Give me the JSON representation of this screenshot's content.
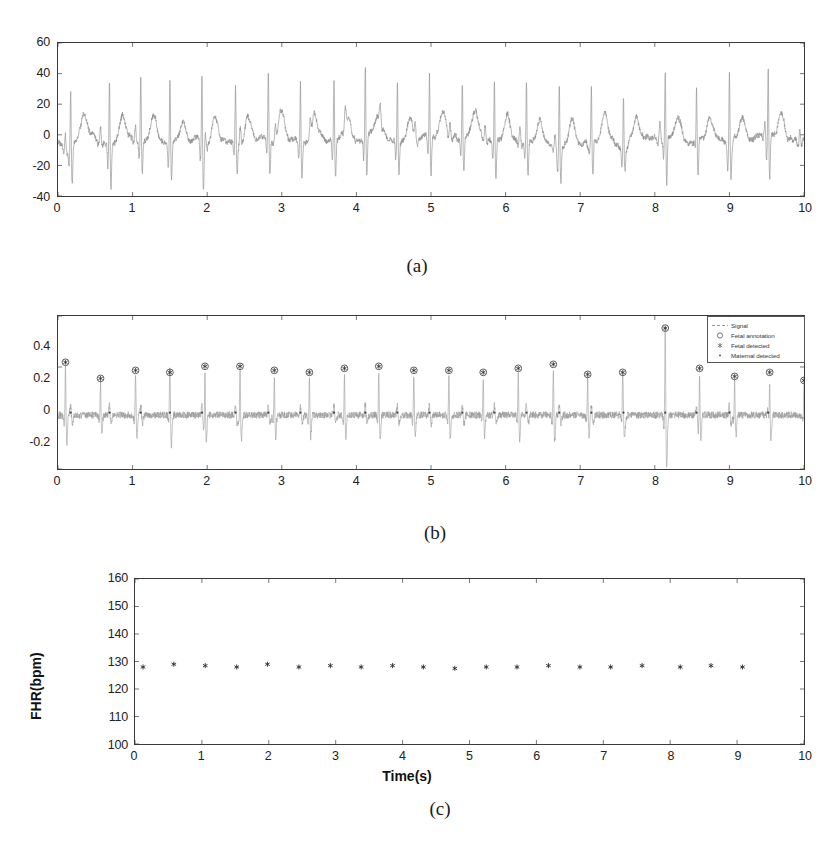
{
  "figure": {
    "panels": [
      {
        "id": "a",
        "caption": "(a)",
        "xlabel": "",
        "ylabel": "",
        "yticks": [
          "60",
          "40",
          "20",
          "0",
          "-20",
          "-40"
        ],
        "xticks": [
          "0",
          "1",
          "2",
          "3",
          "4",
          "5",
          "6",
          "7",
          "8",
          "9",
          "10"
        ]
      },
      {
        "id": "b",
        "caption": "(b)",
        "xlabel": "",
        "ylabel": "",
        "yticks": [
          "0.4",
          "0.2",
          "0",
          "-0.2"
        ],
        "xticks": [
          "0",
          "1",
          "2",
          "3",
          "4",
          "5",
          "6",
          "7",
          "8",
          "9",
          "10"
        ]
      },
      {
        "id": "c",
        "caption": "(c)",
        "xlabel": "Time(s)",
        "ylabel": "FHR(bpm)",
        "yticks": [
          "160",
          "150",
          "140",
          "130",
          "120",
          "110",
          "100"
        ],
        "xticks": [
          "0",
          "1",
          "2",
          "3",
          "4",
          "5",
          "6",
          "7",
          "8",
          "9",
          "10"
        ]
      }
    ],
    "legend": {
      "title": "",
      "items": [
        {
          "label": "Signal",
          "marker": "line"
        },
        {
          "label": "Fetal annotation",
          "marker": "circle"
        },
        {
          "label": "Fetal detected",
          "marker": "asterisk"
        },
        {
          "label": "Maternal detected",
          "marker": "dot"
        }
      ]
    }
  },
  "chart_data": [
    {
      "type": "line",
      "panel": "a",
      "title": "",
      "xlabel": "",
      "ylabel": "",
      "xlim": [
        0,
        10
      ],
      "ylim": [
        -40,
        60
      ],
      "grid": false,
      "legend": "none",
      "series": [
        {
          "name": "Abdominal ECG signal",
          "description": "Raw maternal abdominal ECG containing large maternal QRS spikes and smaller fetal QRS complexes with baseline noise",
          "maternal_qrs_times": [
            0.17,
            0.69,
            1.11,
            1.5,
            1.93,
            2.38,
            2.82,
            3.25,
            3.7,
            4.12,
            4.55,
            4.98,
            5.42,
            5.85,
            6.28,
            6.72,
            7.15,
            7.58,
            8.14,
            8.56,
            9.0,
            9.52
          ],
          "maternal_qrs_peak_amplitudes": [
            38,
            45,
            42,
            38,
            45,
            36,
            43,
            40,
            43,
            46,
            39,
            41,
            38,
            42,
            40,
            42,
            39,
            38,
            44,
            40,
            43,
            46
          ],
          "maternal_qrs_trough_amplitudes": [
            -26,
            -29,
            -22,
            -25,
            -27,
            -20,
            -24,
            -23,
            -25,
            -28,
            -21,
            -24,
            -22,
            -26,
            -23,
            -25,
            -22,
            -24,
            -33,
            -23,
            -25,
            -29
          ],
          "t_wave_peak_amplitude": 15,
          "baseline_noise_range": [
            -10,
            5
          ]
        }
      ]
    },
    {
      "type": "line",
      "panel": "b",
      "title": "",
      "xlabel": "",
      "ylabel": "",
      "xlim": [
        0,
        10
      ],
      "ylim": [
        -0.28,
        0.48
      ],
      "grid": false,
      "legend": "upper right",
      "series": [
        {
          "name": "Signal",
          "description": "Residual signal after maternal ECG cancellation, showing extracted fetal QRS complexes",
          "baseline_noise_range": [
            -0.05,
            0.05
          ]
        },
        {
          "name": "Fetal annotation",
          "marker": "circle",
          "x": [
            0.1,
            0.57,
            1.04,
            1.5,
            1.97,
            2.44,
            2.9,
            3.37,
            3.84,
            4.3,
            4.77,
            5.24,
            5.7,
            6.17,
            6.64,
            7.1,
            7.57,
            8.14,
            8.6,
            9.07,
            9.54,
            10.0
          ],
          "y": [
            0.25,
            0.17,
            0.21,
            0.2,
            0.23,
            0.23,
            0.21,
            0.2,
            0.22,
            0.23,
            0.21,
            0.21,
            0.2,
            0.22,
            0.24,
            0.19,
            0.2,
            0.42,
            0.22,
            0.18,
            0.2,
            0.16
          ]
        },
        {
          "name": "Fetal detected",
          "marker": "asterisk",
          "x": [
            0.1,
            0.57,
            1.04,
            1.5,
            1.97,
            2.44,
            2.9,
            3.37,
            3.84,
            4.3,
            4.77,
            5.24,
            5.7,
            6.17,
            6.64,
            7.1,
            7.57,
            8.14,
            8.6,
            9.07,
            9.54,
            10.0
          ],
          "y": [
            0.25,
            0.17,
            0.21,
            0.2,
            0.23,
            0.23,
            0.21,
            0.2,
            0.22,
            0.23,
            0.21,
            0.21,
            0.2,
            0.22,
            0.24,
            0.19,
            0.2,
            0.42,
            0.22,
            0.18,
            0.2,
            0.16
          ]
        },
        {
          "name": "Maternal detected",
          "marker": "dot",
          "x": [
            0.17,
            0.69,
            1.11,
            1.5,
            1.93,
            2.38,
            2.82,
            3.25,
            3.7,
            4.12,
            4.55,
            4.98,
            5.42,
            5.85,
            6.28,
            6.72,
            7.15,
            7.58,
            8.14,
            8.56,
            9.0,
            9.52
          ],
          "y": [
            0.0,
            0.0,
            0.0,
            0.0,
            0.0,
            0.0,
            0.0,
            0.0,
            0.0,
            0.0,
            0.0,
            0.0,
            0.0,
            0.0,
            0.0,
            0.0,
            0.0,
            0.0,
            0.0,
            0.0,
            0.0,
            0.0
          ]
        }
      ]
    },
    {
      "type": "scatter",
      "panel": "c",
      "title": "",
      "xlabel": "Time(s)",
      "ylabel": "FHR(bpm)",
      "xlim": [
        0,
        10
      ],
      "ylim": [
        100,
        160
      ],
      "grid": false,
      "legend": "none",
      "series": [
        {
          "name": "Fetal heart rate",
          "marker": "asterisk",
          "x": [
            0.12,
            0.58,
            1.05,
            1.52,
            1.98,
            2.45,
            2.92,
            3.38,
            3.85,
            4.31,
            4.78,
            5.25,
            5.71,
            6.18,
            6.65,
            7.11,
            7.58,
            8.15,
            8.61,
            9.08
          ],
          "y": [
            128,
            129,
            128.5,
            128,
            129,
            128,
            128.5,
            128,
            128.5,
            128,
            127.5,
            128,
            128,
            128.5,
            128,
            128,
            128.5,
            128,
            128.5,
            128
          ]
        }
      ]
    }
  ]
}
